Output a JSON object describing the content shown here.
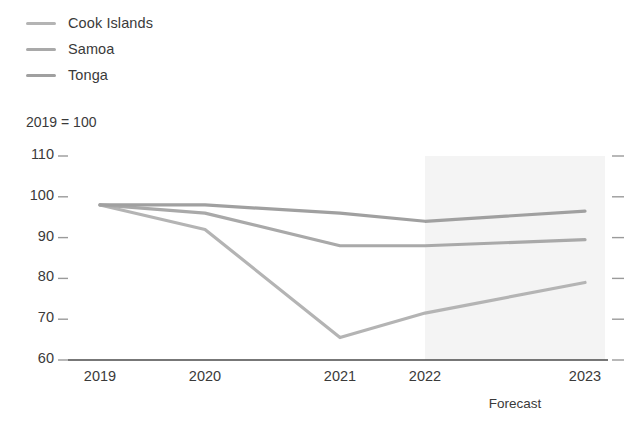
{
  "legend": {
    "position": "top-left",
    "items": [
      {
        "label": "Cook Islands",
        "color": "#b4b4b4"
      },
      {
        "label": "Samoa",
        "color": "#a9a9a9"
      },
      {
        "label": "Tonga",
        "color": "#a0a0a0"
      }
    ]
  },
  "axis_note": "2019 = 100",
  "forecast": {
    "label": "Forecast",
    "start_category": "2022",
    "band_color": "#f4f4f4"
  },
  "chart_data": {
    "type": "line",
    "title": "",
    "subtitle": "",
    "xlabel": "",
    "ylabel": "2019 = 100",
    "categories": [
      "2019",
      "2020",
      "2021",
      "2022",
      "2023"
    ],
    "x": [
      2019,
      2020,
      2021,
      2022,
      2023
    ],
    "ylim": [
      60,
      110
    ],
    "yticks": [
      110,
      100,
      90,
      80,
      70,
      60
    ],
    "ytick_labels": [
      "110",
      "100",
      "90",
      "80",
      "70",
      "60"
    ],
    "grid": false,
    "legend_position": "top-left",
    "annotations": [
      "2019 = 100",
      "Forecast"
    ],
    "series": [
      {
        "name": "Cook Islands",
        "color": "#b4b4b4",
        "values": [
          98,
          92,
          65.5,
          71.5,
          79
        ]
      },
      {
        "name": "Samoa",
        "color": "#a9a9a9",
        "values": [
          98,
          96,
          88,
          88,
          89.5
        ]
      },
      {
        "name": "Tonga",
        "color": "#a0a0a0",
        "values": [
          98,
          98,
          96,
          94,
          96.5
        ]
      }
    ]
  },
  "colors": {
    "axis": "#4a4a4a",
    "tick": "#9a9a9a",
    "text": "#3a3a3a",
    "forecast_band": "#f4f4f4"
  }
}
